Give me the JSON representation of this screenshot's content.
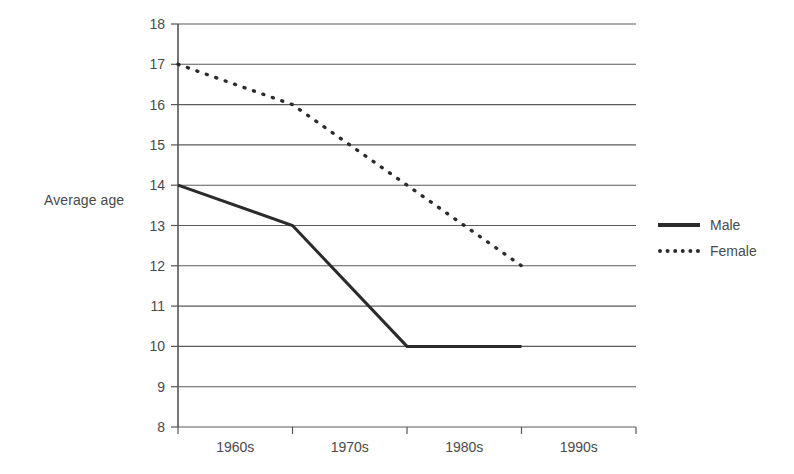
{
  "chart_data": {
    "type": "line",
    "title": "",
    "xlabel": "",
    "ylabel": "Average age",
    "categories": [
      "1960s",
      "1970s",
      "1980s",
      "1990s"
    ],
    "ylim": [
      8,
      18
    ],
    "ytick_labels": [
      "18",
      "17",
      "16",
      "15",
      "14",
      "13",
      "12",
      "11",
      "10",
      "9",
      "8"
    ],
    "ytick_values": [
      18,
      17,
      16,
      15,
      14,
      13,
      12,
      11,
      10,
      9,
      8
    ],
    "grid": true,
    "legend_position": "right",
    "series": [
      {
        "name": "Male",
        "style": "solid",
        "color": "#2b2b2b",
        "values": [
          14,
          13,
          10,
          10
        ]
      },
      {
        "name": "Female",
        "style": "dashed",
        "color": "#2b2b2b",
        "values": [
          17,
          16,
          14,
          12
        ]
      }
    ]
  },
  "legend": {
    "items": [
      {
        "label": "Male",
        "style": "solid"
      },
      {
        "label": "Female",
        "style": "dashed"
      }
    ]
  }
}
